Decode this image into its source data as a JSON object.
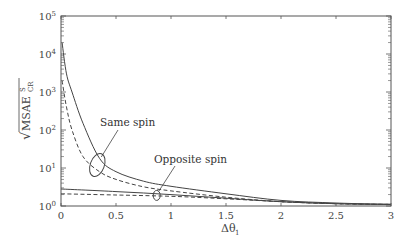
{
  "chart_data": {
    "type": "line",
    "title": "",
    "xlabel": "Δθ1",
    "ylabel": "√MSAE^S_CR",
    "xlim": [
      0,
      3
    ],
    "ylim": [
      1,
      100000
    ],
    "yscale": "log",
    "grid": false,
    "legend": "none (annotations)",
    "x_ticks": [
      "0",
      "0.5",
      "1",
      "1.5",
      "2",
      "2.5",
      "3"
    ],
    "y_ticks": [
      "10^0",
      "10^1",
      "10^2",
      "10^3",
      "10^4",
      "10^5"
    ],
    "annotations": [
      {
        "text": "Same spin",
        "points_to": {
          "x": 0.33,
          "y": 12
        }
      },
      {
        "text": "Opposite spin",
        "points_to": {
          "x": 0.87,
          "y": 2.0
        }
      }
    ],
    "series": [
      {
        "name": "Same spin (solid)",
        "style": "solid",
        "x": [
          0.01,
          0.05,
          0.1,
          0.2,
          0.35,
          0.5,
          0.75,
          1.0,
          1.5,
          2.0,
          2.5,
          3.0
        ],
        "y": [
          20000,
          3000,
          1000,
          150,
          18,
          8,
          4.5,
          3.3,
          2.1,
          1.4,
          1.2,
          1.1
        ]
      },
      {
        "name": "Same spin (dashed)",
        "style": "dashed",
        "x": [
          0.01,
          0.05,
          0.1,
          0.2,
          0.35,
          0.5,
          0.75,
          1.0,
          1.5,
          2.0,
          2.5,
          3.0
        ],
        "y": [
          2000,
          400,
          100,
          20,
          8,
          5,
          3.2,
          2.5,
          1.7,
          1.3,
          1.15,
          1.1
        ]
      },
      {
        "name": "Opposite spin (solid)",
        "style": "solid",
        "x": [
          0,
          0.5,
          1.0,
          1.5,
          2.0,
          2.5,
          3.0
        ],
        "y": [
          2.8,
          2.4,
          2.0,
          1.6,
          1.3,
          1.15,
          1.1
        ]
      },
      {
        "name": "Opposite spin (dashed)",
        "style": "dashed",
        "x": [
          0,
          0.5,
          1.0,
          1.5,
          2.0,
          2.5,
          3.0
        ],
        "y": [
          2.1,
          1.95,
          1.8,
          1.55,
          1.3,
          1.15,
          1.1
        ]
      }
    ]
  },
  "labels": {
    "xlabel_main": "Δθ",
    "xlabel_sub": "1",
    "ylabel_root": "√",
    "ylabel_main": "MSAE",
    "ylabel_sup": "S",
    "ylabel_sub": "CR",
    "ann_same": "Same spin",
    "ann_opposite": "Opposite spin"
  }
}
